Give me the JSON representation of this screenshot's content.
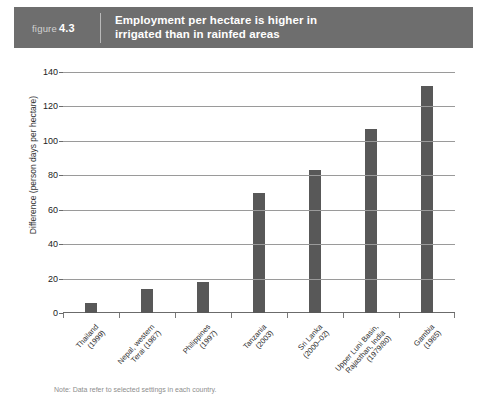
{
  "header": {
    "figure_word": "figure",
    "figure_number": "4.3",
    "title_line1": "Employment per hectare is higher in",
    "title_line2": "irrigated than in rainfed areas",
    "bar_color": "#6e6e6e",
    "title_color": "#ffffff"
  },
  "note": "Note: Data refer to selected settings in each country.",
  "chart_data": {
    "type": "bar",
    "title": "Employment per hectare is higher in irrigated than in rainfed areas",
    "xlabel": "",
    "ylabel": "Difference (person days per hectare)",
    "ylim": [
      0,
      140
    ],
    "ytick_step": 20,
    "yticks": [
      0,
      20,
      40,
      60,
      80,
      100,
      120,
      140
    ],
    "grid": true,
    "legend": false,
    "bar_color": "#585858",
    "categories": [
      "Thailand\n(1999)",
      "Nepal, western\nTerai (1987)",
      "Philippines\n(1997)",
      "Tanzania\n(2003)",
      "Sri Lanka\n(2000–02)",
      "Upper Luni Basin,\nRajasthan, India\n(1979/80)",
      "Gambia\n(1985)"
    ],
    "values": [
      6,
      14,
      18,
      70,
      83,
      107,
      132
    ]
  }
}
